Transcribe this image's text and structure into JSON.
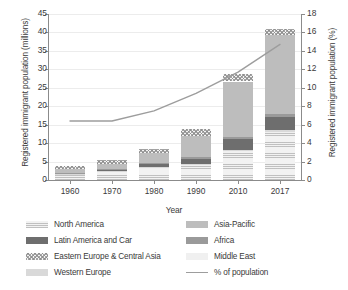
{
  "chart_data": {
    "type": "bar",
    "title": "",
    "subtitle": "",
    "xlabel": "Year",
    "ylabel": "Registered immigrant population (millions)",
    "y2label": "Registered immigrant population (%)",
    "categories": [
      "1960",
      "1970",
      "1980",
      "1990",
      "2010",
      "2017"
    ],
    "ylim": [
      0,
      45
    ],
    "yticks": [
      "0",
      "5",
      "10",
      "15",
      "20",
      "25",
      "30",
      "35",
      "40",
      "45"
    ],
    "y2lim": [
      0,
      18
    ],
    "y2ticks": [
      "0",
      "2",
      "4",
      "6",
      "8",
      "10",
      "12",
      "14",
      "16",
      "18"
    ],
    "grid": true,
    "legend_position": "bottom",
    "stack_order": [
      "North America",
      "Middle East",
      "Western Europe",
      "Latin America and Car",
      "Africa",
      "Asia-Pacific",
      "Eastern Europe & Central Asia"
    ],
    "series": [
      {
        "name": "North America",
        "key": "s-na",
        "values": [
          1.5,
          2.3,
          3.0,
          4.0,
          7.5,
          12.7
        ]
      },
      {
        "name": "Middle East",
        "key": "s-me",
        "values": [
          0.1,
          0.1,
          0.2,
          0.2,
          0.3,
          0.4
        ]
      },
      {
        "name": "Western Europe",
        "key": "s-we",
        "values": [
          0.1,
          0.1,
          0.2,
          0.2,
          0.3,
          0.4
        ]
      },
      {
        "name": "Latin America and Car",
        "key": "s-lac",
        "values": [
          0.2,
          0.4,
          1.0,
          1.3,
          3.0,
          3.7
        ]
      },
      {
        "name": "Africa",
        "key": "s-af",
        "values": [
          0.1,
          0.2,
          0.3,
          0.4,
          0.5,
          0.7
        ]
      },
      {
        "name": "Asia-Pacific",
        "key": "s-ap",
        "values": [
          0.9,
          1.3,
          2.7,
          5.9,
          15.1,
          21.4
        ]
      },
      {
        "name": "Eastern Europe & Central Asia",
        "key": "s-eeca",
        "values": [
          1.0,
          1.1,
          1.1,
          1.7,
          1.9,
          1.5
        ]
      }
    ],
    "line_series": {
      "name": "% of population",
      "axis": "right",
      "color": "#9d9d9d",
      "values": [
        6.4,
        6.4,
        7.5,
        9.4,
        11.7,
        14.7
      ]
    },
    "totals": [
      3.9,
      5.5,
      8.5,
      13.7,
      28.6,
      40.8
    ]
  },
  "axes": {
    "x_title": "Year",
    "y_left_title": "Registered immigrant population (millions)",
    "y_right_title": "Registered immigrant population (%)"
  },
  "legend": {
    "items": [
      {
        "label": "North America",
        "key": "s-na",
        "kind": "swatch"
      },
      {
        "label": "Asia-Pacific",
        "key": "s-ap",
        "kind": "swatch"
      },
      {
        "label": "Latin America and Car",
        "key": "s-lac",
        "kind": "swatch"
      },
      {
        "label": "Africa",
        "key": "s-af",
        "kind": "swatch"
      },
      {
        "label": "Eastern Europe & Central Asia",
        "key": "s-eeca",
        "kind": "swatch"
      },
      {
        "label": "Middle East",
        "key": "s-me",
        "kind": "swatch"
      },
      {
        "label": "Western Europe",
        "key": "s-we",
        "kind": "swatch"
      },
      {
        "label": "% of population",
        "key": "line",
        "kind": "line"
      }
    ]
  },
  "colors": {
    "north_america": "#f2f2f2",
    "latin_america": "#6e6e6e",
    "eastern_europe": "#f4f4f4",
    "western_europe": "#d9d9d9",
    "asia_pacific": "#bdbdbd",
    "africa": "#9a9a9a",
    "middle_east": "#f0f0f0",
    "line": "#9d9d9d",
    "axis": "#8b8b8b",
    "grid": "#ececec",
    "text": "#3a3a3a"
  }
}
